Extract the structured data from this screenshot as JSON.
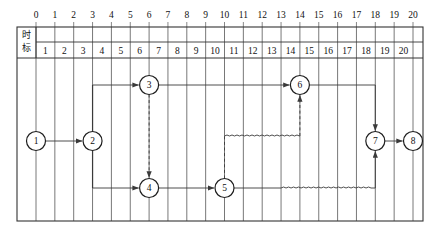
{
  "diagram": {
    "scale_header_label": "时标",
    "scale_header_chars": [
      "时",
      "标"
    ],
    "top_ticks": [
      "0",
      "1",
      "2",
      "3",
      "4",
      "5",
      "6",
      "7",
      "8",
      "9",
      "10",
      "11",
      "12",
      "13",
      "14",
      "15",
      "16",
      "17",
      "18",
      "19",
      "20"
    ],
    "cell_numbers": [
      "1",
      "2",
      "3",
      "4",
      "5",
      "6",
      "7",
      "8",
      "9",
      "10",
      "11",
      "12",
      "13",
      "14",
      "15",
      "16",
      "17",
      "18",
      "19",
      "20"
    ],
    "nodes": [
      {
        "id": "1",
        "label": "1",
        "time": 0,
        "row": "middle"
      },
      {
        "id": "2",
        "label": "2",
        "time": 3,
        "row": "middle"
      },
      {
        "id": "3",
        "label": "3",
        "time": 6,
        "row": "top"
      },
      {
        "id": "4",
        "label": "4",
        "time": 6,
        "row": "bottom"
      },
      {
        "id": "5",
        "label": "5",
        "time": 10,
        "row": "bottom"
      },
      {
        "id": "6",
        "label": "6",
        "time": 14,
        "row": "top"
      },
      {
        "id": "7",
        "label": "7",
        "time": 18,
        "row": "middle"
      },
      {
        "id": "8",
        "label": "8",
        "time": 20,
        "row": "middle"
      }
    ],
    "edges": [
      {
        "from": "1",
        "to": "2",
        "style": "solid",
        "kind": "horizontal"
      },
      {
        "from": "2",
        "to": "3",
        "style": "solid",
        "kind": "riser-up"
      },
      {
        "from": "2",
        "to": "4",
        "style": "solid",
        "kind": "riser-down"
      },
      {
        "from": "3",
        "to": "4",
        "style": "dashed",
        "kind": "vertical"
      },
      {
        "from": "3",
        "to": "6",
        "style": "solid",
        "kind": "horizontal"
      },
      {
        "from": "4",
        "to": "5",
        "style": "solid",
        "kind": "horizontal"
      },
      {
        "from": "5",
        "to": "6",
        "style": "dashed-wavy",
        "kind": "riser-up"
      },
      {
        "from": "5",
        "to": "7",
        "style": "solid-wavy",
        "kind": "horizontal"
      },
      {
        "from": "6",
        "to": "7",
        "style": "solid",
        "kind": "riser-down"
      },
      {
        "from": "7",
        "to": "8",
        "style": "solid",
        "kind": "horizontal"
      }
    ],
    "colors": {
      "line": "#3a3a3a",
      "grid": "#555555",
      "frame": "#333333",
      "text": "#111111",
      "background": "#ffffff"
    }
  }
}
